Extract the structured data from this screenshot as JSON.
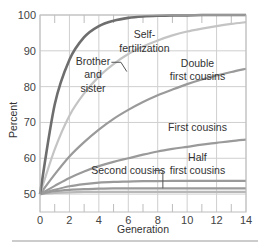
{
  "chart_data": {
    "type": "line",
    "title": "",
    "xlabel": "Generation",
    "ylabel": "Percent",
    "xlim": [
      0,
      14
    ],
    "ylim": [
      45,
      100
    ],
    "x_ticks": [
      0,
      2,
      4,
      6,
      8,
      10,
      12,
      14
    ],
    "y_ticks": [
      50,
      60,
      70,
      80,
      90,
      100
    ],
    "grid": true,
    "legend": "inline annotations",
    "x": [
      0,
      1,
      2,
      3,
      4,
      5,
      6,
      7,
      8,
      9,
      10,
      11,
      12,
      13,
      14
    ],
    "series": [
      {
        "name": "Self-fertilization",
        "color": "#6e6e6e",
        "values": [
          50,
          75,
          87.5,
          93.8,
          96.9,
          98.4,
          99.2,
          99.6,
          99.8,
          99.9,
          99.9,
          100,
          100,
          100,
          100
        ]
      },
      {
        "name": "Brother and sister",
        "color": "#c4c4c4",
        "values": [
          50,
          62.5,
          71.9,
          78.1,
          82.8,
          86.3,
          89.1,
          91.2,
          92.9,
          94.3,
          95.4,
          96.2,
          96.9,
          97.5,
          98
        ]
      },
      {
        "name": "Double first cousins",
        "color": "#9a9a9a",
        "values": [
          50,
          55.5,
          60.5,
          64.5,
          68,
          71,
          73.5,
          75.7,
          77.6,
          79.2,
          80.7,
          82,
          83.1,
          84.1,
          85
        ]
      },
      {
        "name": "First cousins",
        "color": "#9a9a9a",
        "values": [
          50,
          52.3,
          54.5,
          56.3,
          57.8,
          59,
          60,
          61,
          61.9,
          62.6,
          63.2,
          63.8,
          64.3,
          64.8,
          65.2
        ]
      },
      {
        "name": "Second cousins",
        "color": "#9a9a9a",
        "values": [
          50,
          51.2,
          52.2,
          52.8,
          53.2,
          53.4,
          53.5,
          53.6,
          53.6,
          53.7,
          53.7,
          53.7,
          53.7,
          53.7,
          53.7
        ]
      },
      {
        "name": "Half first cousins",
        "color": "#9a9a9a",
        "values": [
          50,
          50.8,
          51.2,
          51.4,
          51.5,
          51.6,
          51.6,
          51.6,
          51.6,
          51.6,
          51.6,
          51.6,
          51.6,
          51.6,
          51.6
        ]
      },
      {
        "name": "Baseline",
        "color": "#b8b8b8",
        "values": [
          50,
          50.3,
          50.5,
          50.6,
          50.6,
          50.6,
          50.6,
          50.6,
          50.6,
          50.6,
          50.6,
          50.6,
          50.6,
          50.6,
          50.6
        ]
      }
    ],
    "annotations": [
      {
        "text": "Self-",
        "x": 7.1,
        "y": 93.5
      },
      {
        "text": "fertilization",
        "x": 7.1,
        "y": 89.7
      },
      {
        "text": "Brother",
        "x": 3.6,
        "y": 86
      },
      {
        "text": "and",
        "x": 3.6,
        "y": 82.3
      },
      {
        "text": "sister",
        "x": 3.6,
        "y": 78.6
      },
      {
        "text": "Double",
        "x": 10.7,
        "y": 85.5
      },
      {
        "text": "first cousins",
        "x": 10.7,
        "y": 81.8
      },
      {
        "text": "First cousins",
        "x": 10.7,
        "y": 67.5
      },
      {
        "text": "Half",
        "x": 10.7,
        "y": 59.2
      },
      {
        "text": "first cousins",
        "x": 10.7,
        "y": 55.5
      },
      {
        "text": "Second cousins",
        "x": 6,
        "y": 55.5
      }
    ]
  }
}
